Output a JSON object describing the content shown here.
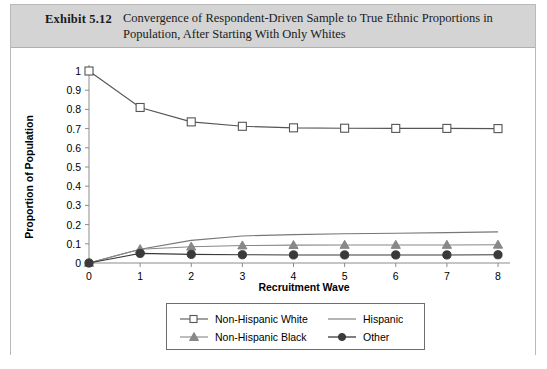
{
  "exhibit": {
    "label": "Exhibit 5.12",
    "title_line1": "Convergence of Respondent-Driven Sample to True Ethnic Proportions in",
    "title_line2": "Population, After Starting With Only Whites",
    "header_bg": "#d4d4d4"
  },
  "chart_data": {
    "type": "line",
    "title": "Convergence of Respondent-Driven Sample to True Ethnic Proportions in Population, After Starting With Only Whites",
    "xlabel": "Recruitment Wave",
    "ylabel": "Proportion of Population",
    "x": [
      0,
      1,
      2,
      3,
      4,
      5,
      6,
      7,
      8
    ],
    "xlim": [
      0,
      8
    ],
    "ylim": [
      0,
      1
    ],
    "xticks": [
      "0",
      "1",
      "2",
      "3",
      "4",
      "5",
      "6",
      "7",
      "8"
    ],
    "yticks": [
      "0",
      "0.1",
      "0.2",
      "0.3",
      "0.4",
      "0.5",
      "0.6",
      "0.7",
      "0.8",
      "0.9",
      "1"
    ],
    "grid": false,
    "legend_position": "bottom-center",
    "series": [
      {
        "name": "Non-Hispanic White",
        "marker": "open-square",
        "color": "#555555",
        "values": [
          1.0,
          0.81,
          0.735,
          0.712,
          0.704,
          0.702,
          0.701,
          0.701,
          0.7
        ]
      },
      {
        "name": "Hispanic",
        "marker": "none",
        "color": "#777777",
        "values": [
          0.0,
          0.072,
          0.118,
          0.141,
          0.148,
          0.152,
          0.155,
          0.158,
          0.162
        ]
      },
      {
        "name": "Non-Hispanic Black",
        "marker": "filled-triangle",
        "color": "#888888",
        "values": [
          0.0,
          0.072,
          0.085,
          0.091,
          0.093,
          0.094,
          0.094,
          0.094,
          0.095
        ]
      },
      {
        "name": "Other",
        "marker": "filled-circle",
        "color": "#3a3a3a",
        "values": [
          0.0,
          0.05,
          0.045,
          0.043,
          0.042,
          0.042,
          0.042,
          0.042,
          0.043
        ]
      }
    ]
  },
  "legend": {
    "items": [
      {
        "label": "Non-Hispanic White",
        "glyph": "open-square-line-icon"
      },
      {
        "label": "Hispanic",
        "glyph": "plain-line-icon"
      },
      {
        "label": "Non-Hispanic Black",
        "glyph": "filled-triangle-line-icon"
      },
      {
        "label": "Other",
        "glyph": "filled-circle-line-icon"
      }
    ]
  }
}
